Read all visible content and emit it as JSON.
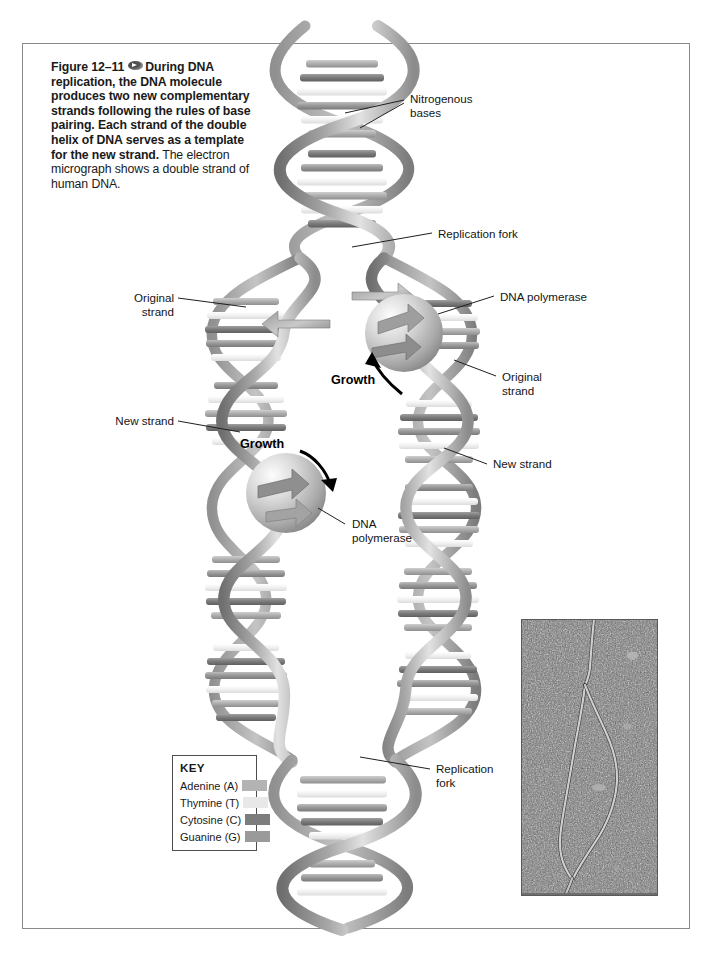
{
  "figure": {
    "number_label": "Figure 12–11",
    "icon": "media-oval-icon",
    "body_bold": "During DNA replication, the DNA molecule produces two new complementary strands following the rules of base pairing. Each strand of the double helix of DNA serves as a template for the new strand.",
    "body_plain": "The electron micrograph shows a double strand of human DNA."
  },
  "labels": {
    "nitrogenous_bases": "Nitrogenous\nbases",
    "replication_fork_top": "Replication fork",
    "dna_polymerase_right": "DNA polymerase",
    "original_strand_right": "Original\nstrand",
    "new_strand_right": "New strand",
    "original_strand_left": "Original\nstrand",
    "new_strand_left": "New strand",
    "dna_polymerase_left": "DNA\npolymerase",
    "replication_fork_bottom": "Replication\nfork",
    "growth_upper": "Growth",
    "growth_lower": "Growth"
  },
  "key": {
    "title": "KEY",
    "rows": [
      {
        "label": "Adenine (A)",
        "color": "#b3b3b3"
      },
      {
        "label": "Thymine (T)",
        "color": "#e8e8e8"
      },
      {
        "label": "Cytosine (C)",
        "color": "#7d7d7d"
      },
      {
        "label": "Guanine (G)",
        "color": "#9a9a9a"
      }
    ]
  },
  "micrograph": {
    "alt": "electron micrograph of a replicating human DNA double strand",
    "background_color": "#6e6e6e",
    "strand_color": "#c9c9c9"
  },
  "diagram": {
    "backbone_color": "#8e8e8e",
    "backbone_light": "#d7d7d7",
    "polymerase_color": "#b8b8b8",
    "frame_color": "#8a8a8a"
  }
}
